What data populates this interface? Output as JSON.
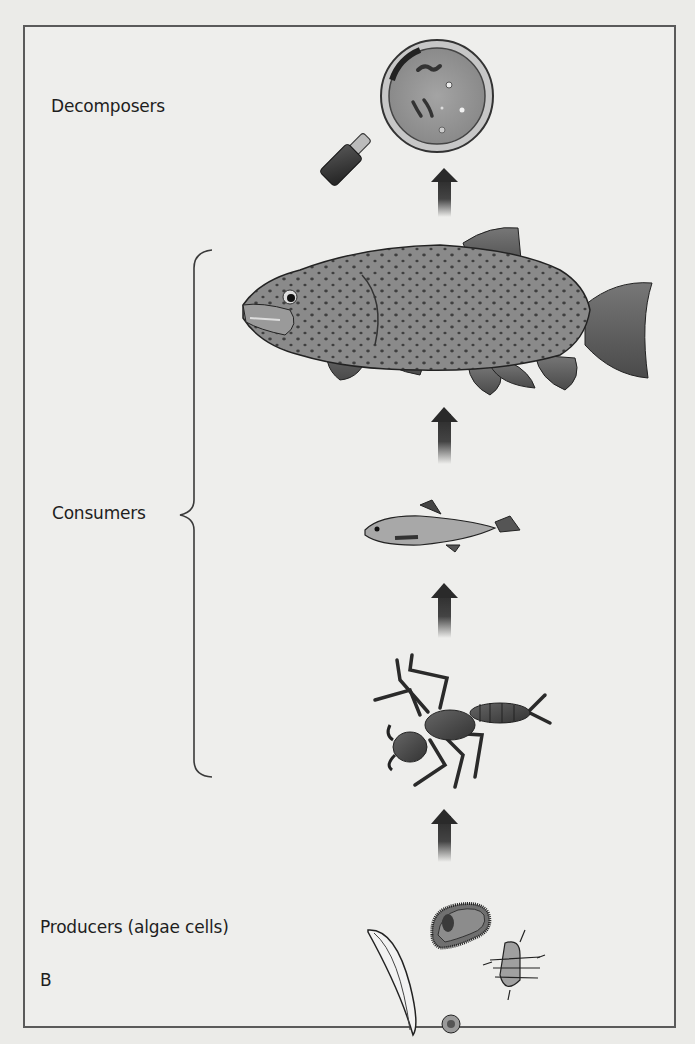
{
  "figure": {
    "panel_label": "B",
    "levels": [
      {
        "label": "Decomposers",
        "organism": "magnifying lens with bacteria"
      },
      {
        "label": "Consumers",
        "organisms": [
          "brown trout",
          "small fish (minnow)",
          "aquatic insect larva (stonefly nymph)"
        ]
      },
      {
        "label": "Producers (algae cells)",
        "organisms": [
          "diatom (crescent)",
          "green alga cell",
          "round alga cell",
          "filamentous alga segment"
        ]
      }
    ],
    "flow_direction": "upward",
    "arrow_count": 4
  }
}
